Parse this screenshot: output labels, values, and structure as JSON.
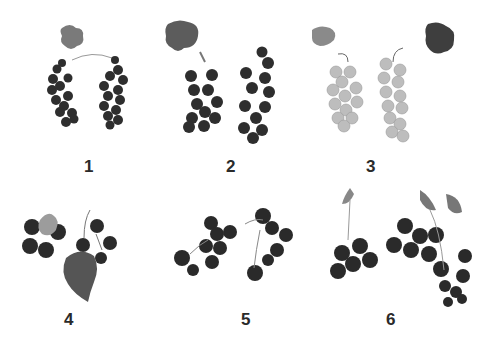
{
  "figure": {
    "panels": [
      {
        "id": 1,
        "label": "1",
        "berry_tone": "dark"
      },
      {
        "id": 2,
        "label": "2",
        "berry_tone": "dark"
      },
      {
        "id": 3,
        "label": "3",
        "berry_tone": "light"
      },
      {
        "id": 4,
        "label": "4",
        "berry_tone": "dark"
      },
      {
        "id": 5,
        "label": "5",
        "berry_tone": "dark"
      },
      {
        "id": 6,
        "label": "6",
        "berry_tone": "dark"
      }
    ]
  },
  "colors": {
    "background": "#ffffff",
    "dark_berry": "#2b2b2b",
    "light_berry": "#b9b9b9",
    "leaf": "#6a6a6a",
    "label": "#2a2a2a"
  }
}
